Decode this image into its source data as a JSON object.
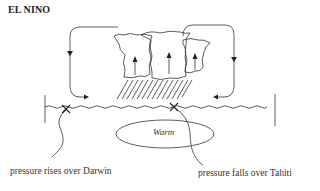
{
  "title": "EL NINO",
  "diagram": {
    "warm_label": "Warm",
    "labels": {
      "darwin": "pressure rises over Darwin",
      "tahiti": "pressure falls over Tahiti"
    },
    "elements": [
      "left-circulation-loop-arrow",
      "right-circulation-loop-arrow",
      "cumulus-clouds-with-updraft-arrows",
      "rain-hatching",
      "sea-surface-wavy-line",
      "darwin-x-marker",
      "tahiti-x-marker",
      "warm-water-pool-ellipse"
    ],
    "colors": {
      "line": "#333333",
      "background": "#ffffff"
    }
  }
}
